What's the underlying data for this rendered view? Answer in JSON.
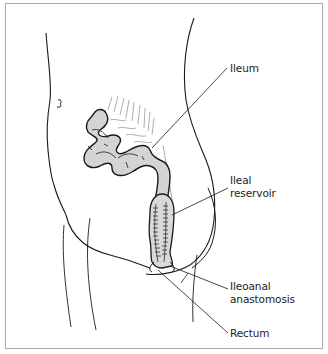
{
  "figure": {
    "type": "anatomical line illustration",
    "colors": {
      "frame": "#a8a8a8",
      "line": "#1a1a1a",
      "intestine_fill": "#d4d4d4",
      "reservoir_fill": "#d9d9d9",
      "mesentery_line": "#777777",
      "label_text": "#222222"
    }
  },
  "labels": [
    {
      "id": "ileum",
      "text": "Ileum"
    },
    {
      "id": "ileal-reservoir",
      "line1": "Ileal",
      "line2": "reservoir"
    },
    {
      "id": "ileoanal-anastomosis",
      "line1": "Ileoanal",
      "line2": "anastomosis"
    },
    {
      "id": "rectum",
      "text": "Rectum"
    }
  ]
}
